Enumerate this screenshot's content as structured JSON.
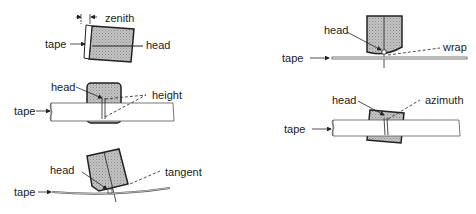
{
  "diagram": {
    "panels": [
      {
        "id": "zenith",
        "labels": {
          "tape": "tape",
          "head": "head",
          "param": "zenith"
        }
      },
      {
        "id": "height",
        "labels": {
          "tape": "tape",
          "head": "head",
          "param": "height"
        }
      },
      {
        "id": "tangent",
        "labels": {
          "tape": "tape",
          "head": "head",
          "param": "tangent"
        }
      },
      {
        "id": "wrap",
        "labels": {
          "tape": "tape",
          "head": "head",
          "param": "wrap"
        }
      },
      {
        "id": "azimuth",
        "labels": {
          "tape": "tape",
          "head": "head",
          "param": "azimuth"
        }
      }
    ],
    "colors": {
      "line": "#222222",
      "head_fill": "#b8b8b8",
      "tape_fill": "#ffffff"
    }
  }
}
